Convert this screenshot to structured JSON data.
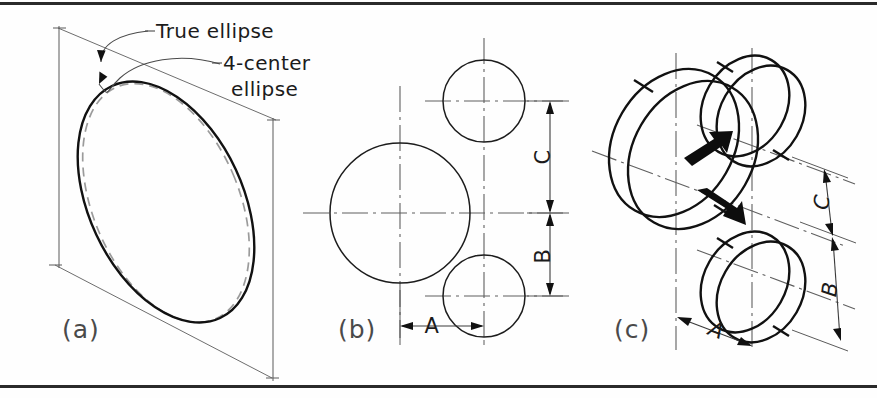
{
  "figure": {
    "border": {
      "top_rule": true,
      "bottom_rule": true,
      "color": "#2a2a2a"
    },
    "background": "#fefefe"
  },
  "callouts": {
    "true_ellipse": "True ellipse",
    "four_center_line1": "4-center",
    "four_center_line2": "ellipse"
  },
  "panels": {
    "a": {
      "label": "(a)",
      "description": "Isometric rhombus enclosing a true ellipse and a 4-center approximate ellipse",
      "curves": [
        {
          "name": "true-ellipse",
          "style": "solid-heavy",
          "color": "#111111"
        },
        {
          "name": "four-center-ellipse",
          "style": "dashed-light",
          "color": "#9b9b9b"
        }
      ]
    },
    "b": {
      "label": "(b)",
      "description": "Orthographic view: one large circle and two smaller circles on centerlines",
      "dimensions": [
        {
          "name": "A",
          "label": "A",
          "orientation": "horizontal",
          "position": "bottom"
        },
        {
          "name": "B",
          "label": "B",
          "orientation": "vertical",
          "position": "right-lower"
        },
        {
          "name": "C",
          "label": "C",
          "orientation": "vertical",
          "position": "right-upper"
        }
      ],
      "circles": [
        {
          "name": "large-circle",
          "size": "large",
          "position": "left-center"
        },
        {
          "name": "small-circle-upper",
          "size": "small",
          "position": "upper-right"
        },
        {
          "name": "small-circle-lower",
          "size": "small",
          "position": "lower-right"
        }
      ]
    },
    "c": {
      "label": "(c)",
      "description": "Isometric pictorial: three cylinders with direction arrows",
      "dimensions": [
        {
          "name": "A",
          "label": "A",
          "orientation": "isometric",
          "position": "bottom"
        },
        {
          "name": "B",
          "label": "B",
          "orientation": "isometric",
          "position": "right-lower"
        },
        {
          "name": "C",
          "label": "C",
          "orientation": "isometric",
          "position": "right-upper"
        }
      ],
      "arrows": [
        {
          "name": "arrow-up-right",
          "direction": "up-right"
        },
        {
          "name": "arrow-down-right",
          "direction": "down-right"
        }
      ],
      "cylinders": [
        {
          "name": "large-cylinder",
          "size": "large",
          "position": "left-center"
        },
        {
          "name": "small-cylinder-upper",
          "size": "small",
          "position": "upper-right"
        },
        {
          "name": "small-cylinder-lower",
          "size": "small",
          "position": "lower-right"
        }
      ]
    }
  }
}
